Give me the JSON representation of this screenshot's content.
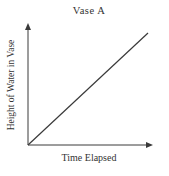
{
  "chart": {
    "title": "Vase A",
    "xlabel": "Time Elapsed",
    "ylabel": "Height of Water in Vase"
  },
  "chart_data": {
    "type": "line",
    "title": "Vase A",
    "xlabel": "Time Elapsed",
    "ylabel": "Height of Water in Vase",
    "x": [
      0,
      1
    ],
    "series": [
      {
        "name": "height-of-water",
        "values": [
          0,
          1
        ]
      }
    ],
    "xlim": [
      0,
      1
    ],
    "ylim": [
      0,
      1
    ],
    "grid": false,
    "legend": false,
    "tick_labels": "none",
    "annotation": "straight line of constant positive slope from origin",
    "line_color": "#3a3a3a",
    "axis_color": "#3a3a3a"
  },
  "colors": {
    "background": "#ffffff",
    "text": "#333333"
  }
}
